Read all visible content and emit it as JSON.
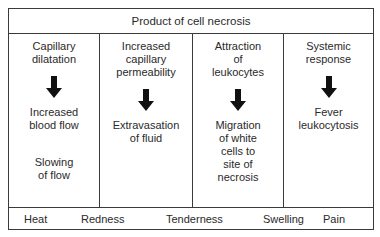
{
  "diagram": {
    "header": "Product of cell necrosis",
    "columns": [
      {
        "title": [
          "Capillary",
          "dilatation"
        ],
        "results": [
          [
            "Increased",
            "blood flow"
          ],
          [
            "Slowing",
            "of flow"
          ]
        ]
      },
      {
        "title": [
          "Increased",
          "capillary",
          "permeability"
        ],
        "results": [
          [
            "Extravasation",
            "of fluid"
          ]
        ]
      },
      {
        "title": [
          "Attraction",
          "of",
          "leukocytes"
        ],
        "results": [
          [
            "Migration",
            "of white",
            "cells to",
            "site of",
            "necrosis"
          ]
        ]
      },
      {
        "title": [
          "Systemic",
          "response"
        ],
        "results": [
          [
            "Fever",
            "leukocytosis"
          ]
        ]
      }
    ],
    "footer": [
      "Heat",
      "Redness",
      "Tenderness",
      "Swelling",
      "Pain"
    ],
    "arrow_icon": "down-arrow-icon",
    "line_color": "#3a3a3a"
  }
}
